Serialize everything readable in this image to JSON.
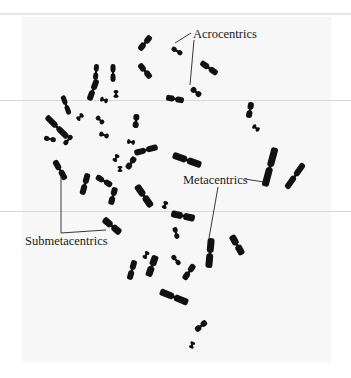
{
  "figure": {
    "background": "#ffffff",
    "panel_color": "#f7f7f7",
    "chromosome_color": "#111111",
    "labels": [
      {
        "id": "acrocentrics",
        "text": "Acrocentrics",
        "x": 193,
        "y": 38
      },
      {
        "id": "metacentrics",
        "text": "Metacentrics",
        "x": 183,
        "y": 184
      },
      {
        "id": "submetacentrics",
        "text": "Submetacentrics",
        "x": 25,
        "y": 245
      }
    ],
    "leaders": [
      {
        "for": "acrocentrics",
        "points": "191,33 175,43"
      },
      {
        "for": "acrocentrics",
        "points": "194,40 190,85"
      },
      {
        "for": "metacentrics",
        "points": "245,179 264,182"
      },
      {
        "for": "metacentrics",
        "points": "218,187 209,238"
      },
      {
        "for": "submetacentrics",
        "points": "61,177 61,233 106,230"
      }
    ],
    "chromosomes": [
      {
        "x": 145,
        "y": 43,
        "len": 18,
        "w": 6,
        "rot": 40
      },
      {
        "x": 177,
        "y": 51,
        "len": 12,
        "w": 5,
        "rot": -60
      },
      {
        "x": 145,
        "y": 71,
        "len": 18,
        "w": 6,
        "rot": -40
      },
      {
        "x": 209,
        "y": 68,
        "len": 20,
        "w": 6,
        "rot": -55
      },
      {
        "x": 96,
        "y": 72,
        "len": 16,
        "w": 5,
        "rot": 5
      },
      {
        "x": 93,
        "y": 90,
        "len": 22,
        "w": 6,
        "rot": 20
      },
      {
        "x": 113,
        "y": 73,
        "len": 18,
        "w": 5,
        "rot": 0
      },
      {
        "x": 116,
        "y": 94,
        "len": 8,
        "w": 5,
        "rot": 0
      },
      {
        "x": 104,
        "y": 100,
        "len": 8,
        "w": 5,
        "rot": -70
      },
      {
        "x": 196,
        "y": 92,
        "len": 12,
        "w": 6,
        "rot": -50
      },
      {
        "x": 175,
        "y": 99,
        "len": 18,
        "w": 6,
        "rot": -80
      },
      {
        "x": 66,
        "y": 105,
        "len": 20,
        "w": 5,
        "rot": -20
      },
      {
        "x": 80,
        "y": 117,
        "len": 8,
        "w": 5,
        "rot": 45
      },
      {
        "x": 100,
        "y": 120,
        "len": 10,
        "w": 5,
        "rot": -45
      },
      {
        "x": 57,
        "y": 127,
        "len": 30,
        "w": 6,
        "rot": -45
      },
      {
        "x": 50,
        "y": 139,
        "len": 12,
        "w": 5,
        "rot": -80
      },
      {
        "x": 68,
        "y": 140,
        "len": 12,
        "w": 5,
        "rot": 40
      },
      {
        "x": 104,
        "y": 135,
        "len": 10,
        "w": 5,
        "rot": -70
      },
      {
        "x": 136,
        "y": 121,
        "len": 14,
        "w": 6,
        "rot": 5
      },
      {
        "x": 131,
        "y": 142,
        "len": 8,
        "w": 5,
        "rot": -80
      },
      {
        "x": 146,
        "y": 150,
        "len": 24,
        "w": 6,
        "rot": 75
      },
      {
        "x": 250,
        "y": 110,
        "len": 16,
        "w": 6,
        "rot": 10
      },
      {
        "x": 256,
        "y": 128,
        "len": 8,
        "w": 5,
        "rot": -50
      },
      {
        "x": 187,
        "y": 160,
        "len": 30,
        "w": 7,
        "rot": -70
      },
      {
        "x": 116,
        "y": 158,
        "len": 8,
        "w": 5,
        "rot": 30
      },
      {
        "x": 120,
        "y": 169,
        "len": 6,
        "w": 5,
        "rot": 0
      },
      {
        "x": 131,
        "y": 163,
        "len": 14,
        "w": 6,
        "rot": 35
      },
      {
        "x": 60,
        "y": 170,
        "len": 22,
        "w": 6,
        "rot": -30
      },
      {
        "x": 85,
        "y": 184,
        "len": 22,
        "w": 6,
        "rot": 15
      },
      {
        "x": 104,
        "y": 181,
        "len": 18,
        "w": 6,
        "rot": -60
      },
      {
        "x": 113,
        "y": 196,
        "len": 18,
        "w": 6,
        "rot": 15
      },
      {
        "x": 144,
        "y": 196,
        "len": 26,
        "w": 7,
        "rot": -35
      },
      {
        "x": 165,
        "y": 205,
        "len": 8,
        "w": 5,
        "rot": 20
      },
      {
        "x": 270,
        "y": 167,
        "len": 40,
        "w": 7,
        "rot": 15
      },
      {
        "x": 295,
        "y": 176,
        "len": 30,
        "w": 6,
        "rot": 35
      },
      {
        "x": 112,
        "y": 226,
        "len": 22,
        "w": 7,
        "rot": -50
      },
      {
        "x": 183,
        "y": 216,
        "len": 24,
        "w": 7,
        "rot": -78
      },
      {
        "x": 176,
        "y": 233,
        "len": 12,
        "w": 5,
        "rot": -15
      },
      {
        "x": 210,
        "y": 253,
        "len": 30,
        "w": 7,
        "rot": 5
      },
      {
        "x": 237,
        "y": 245,
        "len": 22,
        "w": 7,
        "rot": -30
      },
      {
        "x": 146,
        "y": 255,
        "len": 8,
        "w": 5,
        "rot": 30
      },
      {
        "x": 132,
        "y": 270,
        "len": 20,
        "w": 6,
        "rot": 15
      },
      {
        "x": 152,
        "y": 266,
        "len": 22,
        "w": 7,
        "rot": 20
      },
      {
        "x": 176,
        "y": 260,
        "len": 12,
        "w": 5,
        "rot": -40
      },
      {
        "x": 189,
        "y": 272,
        "len": 18,
        "w": 6,
        "rot": 35
      },
      {
        "x": 174,
        "y": 297,
        "len": 30,
        "w": 7,
        "rot": -68
      },
      {
        "x": 201,
        "y": 326,
        "len": 14,
        "w": 6,
        "rot": 50
      },
      {
        "x": 192,
        "y": 345,
        "len": 7,
        "w": 5,
        "rot": 20
      }
    ]
  }
}
